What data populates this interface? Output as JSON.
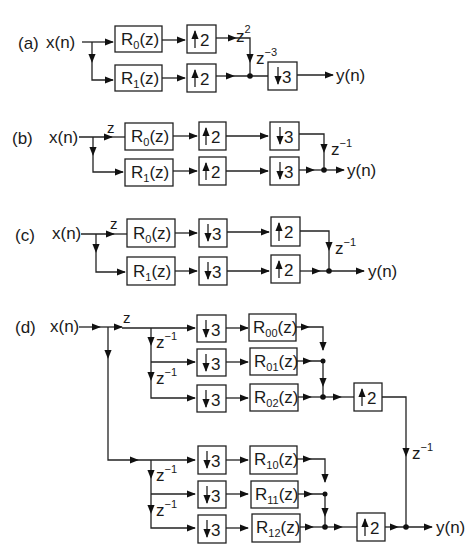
{
  "diagram": {
    "type": "multirate-polyphase-block-diagrams",
    "panels": [
      {
        "id": "a",
        "label": "(a)",
        "input": "x(n)",
        "output": "y(n)",
        "branches": [
          {
            "filter": "R₀(z)",
            "filter_base": "R",
            "filter_sub": "0",
            "upsampler": "↑2",
            "up_factor": "2",
            "delay": "z²",
            "delay_base": "z",
            "delay_exp": "2"
          },
          {
            "filter": "R₁(z)",
            "filter_base": "R",
            "filter_sub": "1",
            "upsampler": "↑2",
            "up_factor": "2"
          }
        ],
        "extra_delay": {
          "base": "z",
          "exp": "−3"
        },
        "downsampler": {
          "factor": "3"
        }
      },
      {
        "id": "b",
        "label": "(b)",
        "input": "x(n)",
        "output": "y(n)",
        "advance": "z",
        "branches": [
          {
            "filter_base": "R",
            "filter_sub": "0",
            "up_factor": "2",
            "down_factor": "3"
          },
          {
            "filter_base": "R",
            "filter_sub": "1",
            "up_factor": "2",
            "down_factor": "3"
          }
        ],
        "delay": {
          "base": "z",
          "exp": "−1"
        }
      },
      {
        "id": "c",
        "label": "(c)",
        "input": "x(n)",
        "output": "y(n)",
        "advance": "z",
        "branches": [
          {
            "filter_base": "R",
            "filter_sub": "0",
            "down_factor": "3",
            "up_factor": "2"
          },
          {
            "filter_base": "R",
            "filter_sub": "1",
            "down_factor": "3",
            "up_factor": "2"
          }
        ],
        "delay": {
          "base": "z",
          "exp": "−1"
        }
      },
      {
        "id": "d",
        "label": "(d)",
        "input": "x(n)",
        "output": "y(n)",
        "advance": "z",
        "groups": [
          {
            "branches": [
              {
                "down_factor": "3",
                "filter_base": "R",
                "filter_sub": "00"
              },
              {
                "down_factor": "3",
                "filter_base": "R",
                "filter_sub": "01"
              },
              {
                "down_factor": "3",
                "filter_base": "R",
                "filter_sub": "02"
              }
            ],
            "chain_delays": [
              {
                "base": "z",
                "exp": "−1"
              },
              {
                "base": "z",
                "exp": "−1"
              }
            ],
            "up_factor": "2"
          },
          {
            "branches": [
              {
                "down_factor": "3",
                "filter_base": "R",
                "filter_sub": "10"
              },
              {
                "down_factor": "3",
                "filter_base": "R",
                "filter_sub": "11"
              },
              {
                "down_factor": "3",
                "filter_base": "R",
                "filter_sub": "12"
              }
            ],
            "chain_delays": [
              {
                "base": "z",
                "exp": "−1"
              },
              {
                "base": "z",
                "exp": "−1"
              }
            ],
            "up_factor": "2"
          }
        ],
        "output_delay": {
          "base": "z",
          "exp": "−1"
        }
      }
    ],
    "common": {
      "filter_suffix": "(z)",
      "colors": {
        "ink": "#222222",
        "background": "#ffffff"
      }
    }
  }
}
